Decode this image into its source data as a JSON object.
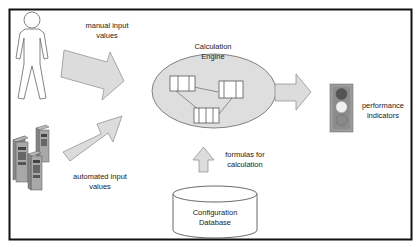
{
  "diagram": {
    "labels": {
      "manual_line1": "manual input",
      "manual_line2": "values",
      "automated_line1": "automated input",
      "automated_line2": "values",
      "engine_line1": "Calculation",
      "engine_line2": "Engine",
      "formulas_line1": "formulas for",
      "formulas_line2": "calculation",
      "db_line1": "Configuration",
      "db_line2": "Database",
      "perf_line1": "performance",
      "perf_line2": "indicators"
    },
    "icons": [
      "person-icon",
      "server-icon",
      "arrow-icon",
      "database-icon",
      "traffic-light-icon"
    ],
    "colors": {
      "border": "#111111",
      "arrow_fill": "#dcdcdc",
      "ellipse_fill": "#dedede",
      "light_top": "#555555",
      "light_mid": "#f0f0f0",
      "light_bottom": "#8a8a8a",
      "light_housing": "#9a9a9a"
    }
  }
}
